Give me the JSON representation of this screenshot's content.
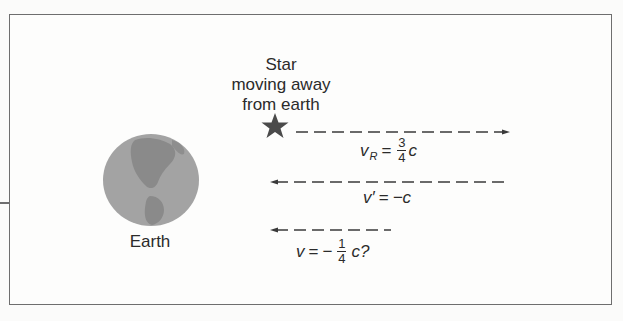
{
  "diagram": {
    "labels": {
      "star": [
        "Star",
        "moving away",
        "from earth"
      ],
      "earth": "Earth"
    },
    "arrows": [
      {
        "name": "star-velocity",
        "direction": "right",
        "equation": {
          "var": "v",
          "sub": "R",
          "op": "=",
          "num": "3",
          "den": "4",
          "suffix": "c"
        }
      },
      {
        "name": "light-velocity-star-frame",
        "direction": "left",
        "equation": {
          "var": "v′",
          "op": "=",
          "value": "−c"
        }
      },
      {
        "name": "light-velocity-earth-frame-naive",
        "direction": "left",
        "equation": {
          "var": "v",
          "op": "=",
          "sign": "−",
          "num": "1",
          "den": "4",
          "suffix": "c?"
        }
      }
    ],
    "icons": {
      "star": "star-icon",
      "earth": "earth-globe-icon"
    },
    "colors": {
      "frame": "#6e6e6e",
      "ink": "#2b2b2b",
      "earth_base": "#a3a3a3",
      "earth_land": "#8a8a8a",
      "star": "#4a4a4a"
    }
  }
}
